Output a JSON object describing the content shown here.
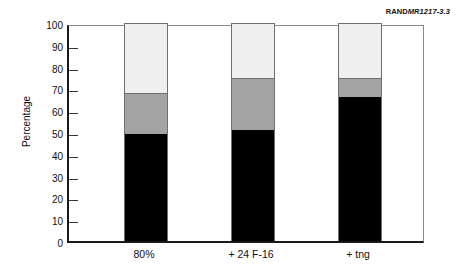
{
  "credit": {
    "prefix": "RAND",
    "number": "MR1217-3.3"
  },
  "chart_data": {
    "type": "bar",
    "subtype": "stacked-vertical",
    "title": "",
    "xlabel": "",
    "ylabel": "Percentage",
    "ylim": [
      0,
      100
    ],
    "ytick_step": 10,
    "yticks": [
      0,
      10,
      20,
      30,
      40,
      50,
      60,
      70,
      80,
      90,
      100
    ],
    "ytick_labels": [
      "0",
      "10",
      "20",
      "30",
      "40",
      "50",
      "60",
      "70",
      "80",
      "90",
      "100"
    ],
    "grid": false,
    "legend": "none",
    "categories": [
      "80%",
      "+ 24 F-16",
      "+ tng"
    ],
    "series": [
      {
        "name": "bottom-segment",
        "color": "#000000",
        "values": [
          49,
          51,
          66
        ]
      },
      {
        "name": "middle-segment",
        "color": "#a3a3a3",
        "values": [
          19,
          24,
          9
        ]
      },
      {
        "name": "top-segment",
        "color": "#efefef",
        "values": [
          32,
          25,
          25
        ]
      }
    ],
    "cumulative_tops": [
      [
        49,
        68,
        100
      ],
      [
        51,
        75,
        100
      ],
      [
        66,
        75,
        100
      ]
    ]
  }
}
